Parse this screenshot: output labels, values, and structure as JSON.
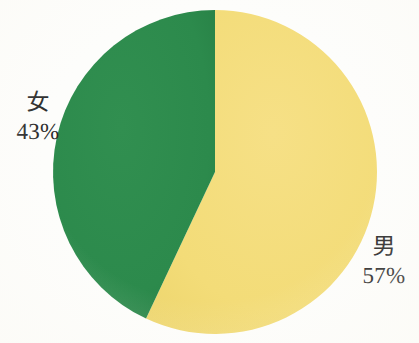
{
  "chart_data": {
    "type": "pie",
    "title": "",
    "subtitle": "",
    "xlabel": "",
    "ylabel": "",
    "legend_position": "none",
    "grid": false,
    "labels_inline": true,
    "start_angle_deg": 0,
    "direction": "clockwise",
    "categories": [
      "男",
      "女"
    ],
    "values": [
      57,
      43
    ],
    "unit": "%",
    "slices": [
      {
        "name": "男",
        "value": 57,
        "value_text": "57%",
        "color": "#f3dc78",
        "start_angle_deg": 0,
        "end_angle_deg": 205.2,
        "label_position": "right"
      },
      {
        "name": "女",
        "value": 43,
        "value_text": "43%",
        "color": "#2c8a4c",
        "start_angle_deg": 205.2,
        "end_angle_deg": 360,
        "label_position": "left"
      }
    ]
  },
  "figure": {
    "background_color": "#fdfdfb",
    "text_color": "#2a2a2a",
    "center_x": 215,
    "center_y": 172,
    "radius": 162
  }
}
